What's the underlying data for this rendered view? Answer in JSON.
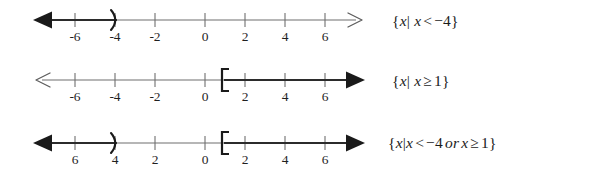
{
  "figure": {
    "axis": {
      "min": -7.6,
      "max": 7.6,
      "tick_values": [
        -6,
        -4,
        -2,
        0,
        2,
        4,
        6
      ],
      "tick_spacing_px": 20,
      "origin_x_px": 205,
      "left_arrow": true,
      "right_arrow": true
    },
    "colors": {
      "background": "#ffffff",
      "axis": "#6f6f6f",
      "tick": "#6f6f6f",
      "shading_dark": "#2a2a2a",
      "shading_light": "#8d8d8d",
      "arrowhead": "#1a1a1a",
      "text": "#1b1b1b"
    }
  },
  "rows": [
    {
      "name": "x-less-than-negative-four",
      "tick_labels": [
        "-6",
        "-4",
        "-2",
        "0",
        "2",
        "4",
        "6"
      ],
      "intervals": [
        {
          "name": "left-ray-open-at-negative-four",
          "from": -7.2,
          "to": -4,
          "endpoint_value": -4,
          "endpoint_symbol": ")",
          "endpoint_type": "open",
          "direction": "left",
          "arrow": true
        }
      ],
      "notation": {
        "open_brace": "{",
        "variable": "x",
        "bar": "|",
        "variable2": "x",
        "operator": "<",
        "value": "−4",
        "close_brace": "}",
        "full": "{x| x < −4}"
      }
    },
    {
      "name": "x-greater-than-or-equal-one",
      "tick_labels": [
        "-6",
        "-4",
        "-2",
        "0",
        "2",
        "4",
        "6"
      ],
      "intervals": [
        {
          "name": "right-ray-closed-at-one",
          "from": 1,
          "to": 7.2,
          "endpoint_value": 1,
          "endpoint_symbol": "[",
          "endpoint_type": "closed",
          "direction": "right",
          "arrow": true
        }
      ],
      "notation": {
        "open_brace": "{",
        "variable": "x",
        "bar": "|",
        "variable2": "x",
        "operator": "≥",
        "value": "1",
        "close_brace": "}",
        "full": "{x| x ≥ 1}"
      }
    },
    {
      "name": "union-of-both-inequalities",
      "tick_labels": [
        "6",
        "4",
        "2",
        "0",
        "2",
        "4",
        "6"
      ],
      "tick_labels_minus_hidden": true,
      "intervals": [
        {
          "name": "left-ray-open-at-negative-four",
          "from": -7.2,
          "to": -4,
          "endpoint_value": -4,
          "endpoint_symbol": ")",
          "endpoint_type": "open",
          "direction": "left",
          "arrow": true
        },
        {
          "name": "right-ray-closed-at-one",
          "from": 1,
          "to": 7.2,
          "endpoint_value": 1,
          "endpoint_symbol": "[",
          "endpoint_type": "closed",
          "direction": "right",
          "arrow": true
        }
      ],
      "notation": {
        "open_brace": "{",
        "variable": "x",
        "bar": "|",
        "variable2": "x",
        "operator": "<",
        "value": "−4",
        "conjunction": "or",
        "variable3": "x",
        "operator2": "≥",
        "value2": "1",
        "close_brace": "}",
        "full": "{x| x < −4 or x ≥ 1}"
      }
    }
  ]
}
